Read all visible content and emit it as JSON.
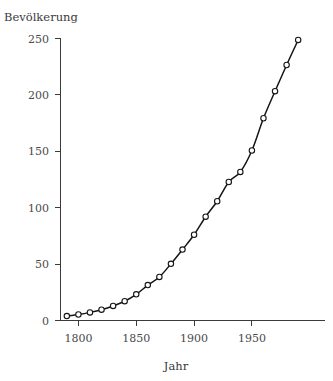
{
  "chart_data": {
    "type": "scatter",
    "title": "",
    "xlabel": "Jahr",
    "ylabel": "Bevölkerung",
    "grid": false,
    "legend": null,
    "xlim": [
      1785,
      1998
    ],
    "ylim": [
      -6,
      262
    ],
    "xticks": [
      1800,
      1850,
      1900,
      1950
    ],
    "yticks": [
      0,
      50,
      100,
      150,
      200,
      250
    ],
    "xtick_labels": [
      "1800",
      "1850",
      "1900",
      "1950"
    ],
    "ytick_labels": [
      "0",
      "50",
      "100",
      "150",
      "200",
      "250"
    ],
    "marker_style": "open-circle",
    "has_fit_curve": true,
    "fit_curve_style": "smooth-solid",
    "x": [
      1790,
      1800,
      1810,
      1820,
      1830,
      1840,
      1850,
      1860,
      1870,
      1880,
      1890,
      1900,
      1910,
      1920,
      1930,
      1940,
      1950,
      1960,
      1970,
      1980,
      1990
    ],
    "values": [
      3.9,
      5.3,
      7.2,
      9.6,
      12.9,
      17.1,
      23.2,
      31.4,
      38.6,
      50.2,
      62.9,
      76.0,
      92.0,
      105.7,
      122.8,
      131.7,
      150.7,
      179.3,
      203.3,
      226.5,
      248.7
    ],
    "series": [
      {
        "name": "Bevölkerung",
        "values": [
          3.9,
          5.3,
          7.2,
          9.6,
          12.9,
          17.1,
          23.2,
          31.4,
          38.6,
          50.2,
          62.9,
          76.0,
          92.0,
          105.7,
          122.8,
          131.7,
          150.7,
          179.3,
          203.3,
          226.5,
          248.7
        ]
      }
    ]
  },
  "colors": {
    "background": "#ffffff",
    "axis": "#3b3b3b",
    "text": "#3a3a3a",
    "curve": "#151515",
    "marker_fill": "#ffffff",
    "marker_stroke": "#151515"
  }
}
